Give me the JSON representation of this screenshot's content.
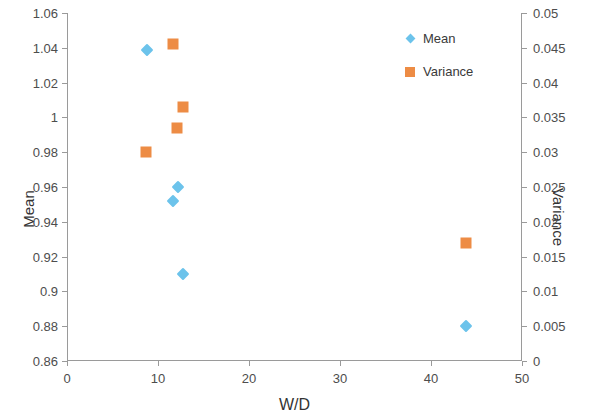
{
  "chart_data": {
    "type": "scatter",
    "title": "",
    "xlabel": "W/D",
    "ylabel": "Mean",
    "y2label": "Variance",
    "xlim": [
      0,
      50
    ],
    "ylim": [
      0.86,
      1.06
    ],
    "y2lim": [
      0,
      0.05
    ],
    "grid": false,
    "legend_position": "top-right",
    "x_ticks": [
      "0",
      "10",
      "20",
      "30",
      "40",
      "50"
    ],
    "x_tick_values": [
      0,
      10,
      20,
      30,
      40,
      50
    ],
    "y_ticks": [
      "0.86",
      "0.88",
      "0.9",
      "0.92",
      "0.94",
      "0.96",
      "0.98",
      "1",
      "1.02",
      "1.04",
      "1.06"
    ],
    "y_tick_values": [
      0.86,
      0.88,
      0.9,
      0.92,
      0.94,
      0.96,
      0.98,
      1.0,
      1.02,
      1.04,
      1.06
    ],
    "y2_ticks": [
      "0",
      "0.005",
      "0.01",
      "0.015",
      "0.02",
      "0.025",
      "0.03",
      "0.035",
      "0.04",
      "0.045",
      "0.05"
    ],
    "y2_tick_values": [
      0,
      0.005,
      0.01,
      0.015,
      0.02,
      0.025,
      0.03,
      0.035,
      0.04,
      0.045,
      0.05
    ],
    "series": [
      {
        "name": "Mean",
        "axis": "left",
        "marker": "diamond",
        "color": "#6CC3EB",
        "points": [
          {
            "x": 8.8,
            "y": 1.039
          },
          {
            "x": 12.2,
            "y": 0.96
          },
          {
            "x": 11.6,
            "y": 0.952
          },
          {
            "x": 12.8,
            "y": 0.91
          },
          {
            "x": 43.9,
            "y": 0.88
          }
        ]
      },
      {
        "name": "Variance",
        "axis": "right",
        "marker": "square",
        "color": "#ED8C45",
        "points": [
          {
            "x": 11.7,
            "y": 0.0455
          },
          {
            "x": 12.8,
            "y": 0.0365
          },
          {
            "x": 12.1,
            "y": 0.0335
          },
          {
            "x": 8.7,
            "y": 0.03
          },
          {
            "x": 43.9,
            "y": 0.017
          }
        ]
      }
    ]
  },
  "legend": {
    "items": [
      {
        "label": "Mean",
        "color": "#6CC3EB",
        "marker": "diamond"
      },
      {
        "label": "Variance",
        "color": "#ED8C45",
        "marker": "square"
      }
    ]
  },
  "axes": {
    "x_title": "W/D",
    "y_left_title": "Mean",
    "y_right_title": "Variance"
  }
}
